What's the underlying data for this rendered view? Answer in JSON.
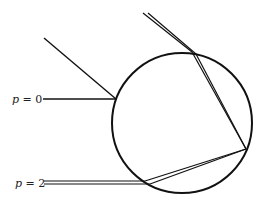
{
  "diagram": {
    "type": "ray-optics-sphere",
    "labels": {
      "p0": {
        "var": "p",
        "eq": " = ",
        "val": "0"
      },
      "p2": {
        "var": "p",
        "eq": " = ",
        "val": "2"
      }
    },
    "colors": {
      "stroke": "#111111",
      "background": "#ffffff",
      "text": "#222222"
    },
    "circle": {
      "cx": 182,
      "cy": 123,
      "r": 70
    }
  }
}
